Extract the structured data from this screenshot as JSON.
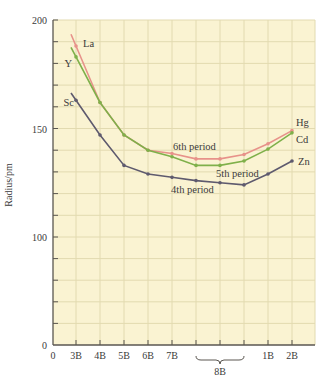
{
  "chart_data": {
    "type": "line",
    "title": "",
    "xlabel": "",
    "ylabel": "Radius/pm",
    "ylim": [
      0,
      200
    ],
    "y_axis_note": "broken scale: 0-100 compressed (ticks every 20), 100-200 expanded (ticks every 10)",
    "y_ticks_major": [
      0,
      100,
      150,
      200
    ],
    "y_ticks_minor_lower": [
      20,
      40,
      60,
      80
    ],
    "y_ticks_minor_upper": [
      110,
      120,
      130,
      140,
      160,
      170,
      180,
      190
    ],
    "grid": true,
    "categories": [
      "3B",
      "4B",
      "5B",
      "6B",
      "7B",
      "8B-a",
      "8B-b",
      "8B-c",
      "1B",
      "2B"
    ],
    "x_tick_labels": [
      {
        "label": "0",
        "index": -1
      },
      {
        "label": "3B",
        "index": 0
      },
      {
        "label": "4B",
        "index": 1
      },
      {
        "label": "5B",
        "index": 2
      },
      {
        "label": "6B",
        "index": 3
      },
      {
        "label": "7B",
        "index": 4
      },
      {
        "label": "1B",
        "index": 8
      },
      {
        "label": "2B",
        "index": 9
      }
    ],
    "group_label": {
      "label": "8B",
      "from_index": 5,
      "to_index": 7
    },
    "series": [
      {
        "name": "4th period",
        "start_label": "Sc",
        "end_label": "Zn",
        "color": "#5e5a6e",
        "values": [
          163,
          147,
          133,
          129,
          127.5,
          126,
          125,
          124,
          129,
          135
        ]
      },
      {
        "name": "5th period",
        "start_label": "Y",
        "end_label": "Cd",
        "color": "#7fb04a",
        "values": [
          183,
          162,
          147,
          140,
          137,
          133,
          133,
          135,
          140.5,
          148
        ]
      },
      {
        "name": "6th period",
        "start_label": "La",
        "end_label": "Hg",
        "color": "#e7928a",
        "values": [
          188,
          162,
          147,
          140,
          138.5,
          136,
          136,
          138,
          143,
          149
        ]
      }
    ],
    "annotations": [
      {
        "text": "6th period",
        "series": "6th period"
      },
      {
        "text": "5th period",
        "series": "5th period"
      },
      {
        "text": "4th period",
        "series": "4th period"
      }
    ]
  },
  "colors": {
    "plot_background": "#faf3d2",
    "grid": "#e2dab0",
    "axis": "#5a5650"
  }
}
